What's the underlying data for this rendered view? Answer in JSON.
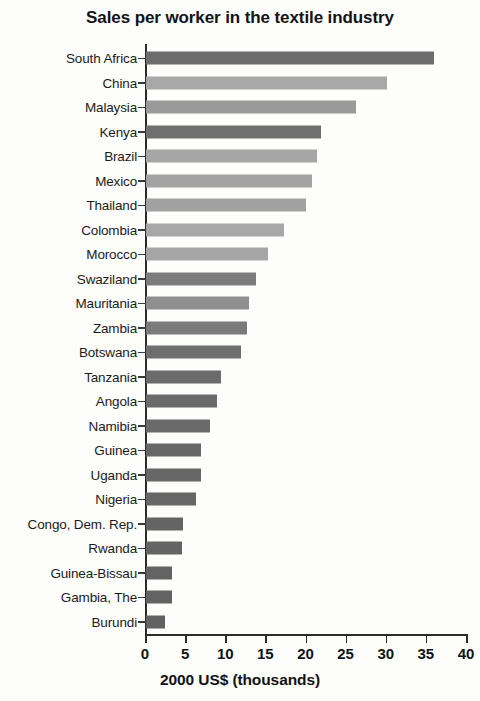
{
  "chart_data": {
    "type": "bar",
    "orientation": "horizontal",
    "title": "Sales per worker in the textile industry",
    "xlabel": "2000 US$ (thousands)",
    "ylabel": "",
    "xlim": [
      0,
      40
    ],
    "xticks": [
      0,
      5,
      10,
      15,
      20,
      25,
      30,
      35,
      40
    ],
    "grid": false,
    "legend": null,
    "categories": [
      "South Africa",
      "China",
      "Malaysia",
      "Kenya",
      "Brazil",
      "Mexico",
      "Thailand",
      "Colombia",
      "Morocco",
      "Swaziland",
      "Mauritania",
      "Zambia",
      "Botswana",
      "Tanzania",
      "Angola",
      "Namibia",
      "Guinea",
      "Uganda",
      "Nigeria",
      "Congo, Dem. Rep.",
      "Rwanda",
      "Guinea-Bissau",
      "Gambia, The",
      "Burundi"
    ],
    "values": [
      35.9,
      30.0,
      26.2,
      21.8,
      21.3,
      20.7,
      19.9,
      17.2,
      15.2,
      13.7,
      12.8,
      12.6,
      11.8,
      9.3,
      8.8,
      8.0,
      6.9,
      6.8,
      6.2,
      4.6,
      4.5,
      3.3,
      3.2,
      2.4
    ],
    "bar_colors": [
      "#6d6d6d",
      "#a8a8a8",
      "#9a9a9a",
      "#6f6f6f",
      "#a6a6a6",
      "#a3a3a3",
      "#a1a1a1",
      "#a8a8a8",
      "#a5a5a5",
      "#7c7c7c",
      "#8f8f8f",
      "#7a7a7a",
      "#6e6e6e",
      "#6b6b6b",
      "#6a6a6a",
      "#6a6a6a",
      "#676767",
      "#676767",
      "#666666",
      "#646464",
      "#646464",
      "#636363",
      "#636363",
      "#626262"
    ]
  },
  "axis": {
    "tick_labels": [
      "0",
      "5",
      "10",
      "15",
      "20",
      "25",
      "30",
      "35",
      "40"
    ]
  }
}
